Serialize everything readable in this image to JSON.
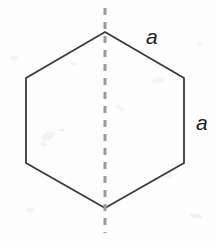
{
  "figure": {
    "name": "regular-hexagon-with-axis-of-symmetry",
    "canvas": {
      "width": 216,
      "height": 241
    },
    "background_color": "#fdfdfd",
    "shape": {
      "type": "hexagon",
      "sides": 6,
      "stroke_color": "#3a3a3a",
      "stroke_width": 1.8,
      "fill": "none",
      "vertices": [
        {
          "name": "top",
          "x": 105,
          "y": 32
        },
        {
          "name": "upper-right",
          "x": 184,
          "y": 78
        },
        {
          "name": "lower-right",
          "x": 184,
          "y": 163
        },
        {
          "name": "bottom",
          "x": 105,
          "y": 208
        },
        {
          "name": "lower-left",
          "x": 26,
          "y": 163
        },
        {
          "name": "upper-left",
          "x": 26,
          "y": 78
        }
      ]
    },
    "symmetry_axis": {
      "name": "vertical-dashed-axis",
      "x": 105,
      "y_start": 8,
      "y_end": 233,
      "color": "#9a9a9a",
      "stroke_width": 3,
      "dash": "7 7"
    },
    "labels": [
      {
        "id": "slant-a",
        "text": "a",
        "labels_edge": "top-to-upper-right",
        "x": 152,
        "y": 36,
        "color": "#1d1d1d",
        "font_size": 21,
        "italic": true
      },
      {
        "id": "vertical-a",
        "text": "a",
        "labels_edge": "upper-right-to-lower-right",
        "x": 202,
        "y": 122,
        "color": "#1d1d1d",
        "font_size": 21,
        "italic": true
      }
    ]
  }
}
